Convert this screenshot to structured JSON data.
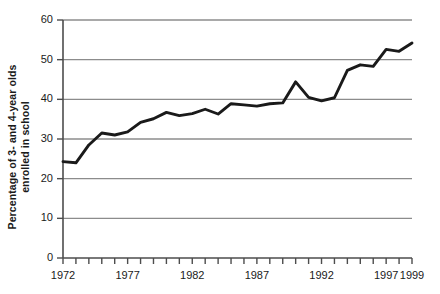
{
  "chart_data": {
    "type": "line",
    "title": "",
    "xlabel": "",
    "ylabel": "Percentage of 3- and 4-year olds enrolled in school",
    "ylabel_line1": "Percentage of 3- and 4-year olds",
    "ylabel_line2": "enrolled in school",
    "xlim": [
      1972,
      1999
    ],
    "ylim": [
      0,
      60
    ],
    "yticks": [
      0,
      10,
      20,
      30,
      40,
      50,
      60
    ],
    "ytick_labels": [
      "0",
      "10",
      "20",
      "30",
      "40",
      "50",
      "60"
    ],
    "xticks": [
      1972,
      1973,
      1974,
      1975,
      1976,
      1977,
      1978,
      1979,
      1980,
      1981,
      1982,
      1983,
      1984,
      1985,
      1986,
      1987,
      1988,
      1989,
      1990,
      1991,
      1992,
      1993,
      1994,
      1995,
      1996,
      1997,
      1998,
      1999
    ],
    "xtick_labels_shown": [
      "1972",
      "1977",
      "1982",
      "1987",
      "1992",
      "1997",
      "1999"
    ],
    "xtick_labels_shown_values": [
      1972,
      1977,
      1982,
      1987,
      1992,
      1997,
      1999
    ],
    "grid": true,
    "grid_axis": "y",
    "legend": "none",
    "line_color": "#1a1a1a",
    "grid_color": "#8c8c8c",
    "axis_color": "#4d4d4d",
    "background_color": "#ffffff",
    "x": [
      1972,
      1973,
      1974,
      1975,
      1976,
      1977,
      1978,
      1979,
      1980,
      1981,
      1982,
      1983,
      1984,
      1985,
      1986,
      1987,
      1988,
      1989,
      1990,
      1991,
      1992,
      1993,
      1994,
      1995,
      1996,
      1997,
      1998,
      1999
    ],
    "values": [
      24.3,
      24.0,
      28.5,
      31.5,
      31.0,
      31.8,
      34.2,
      35.1,
      36.7,
      35.9,
      36.4,
      37.5,
      36.3,
      38.9,
      38.6,
      38.3,
      38.9,
      39.1,
      44.4,
      40.5,
      39.6,
      40.4,
      47.3,
      48.7,
      48.3,
      52.6,
      52.1,
      54.2
    ],
    "series": [
      {
        "name": "Percentage of 3- and 4-year olds enrolled in school",
        "values": [
          24.3,
          24.0,
          28.5,
          31.5,
          31.0,
          31.8,
          34.2,
          35.1,
          36.7,
          35.9,
          36.4,
          37.5,
          36.3,
          38.9,
          38.6,
          38.3,
          38.9,
          39.1,
          44.4,
          40.5,
          39.6,
          40.4,
          47.3,
          48.7,
          48.3,
          52.6,
          52.1,
          54.2
        ]
      }
    ]
  }
}
